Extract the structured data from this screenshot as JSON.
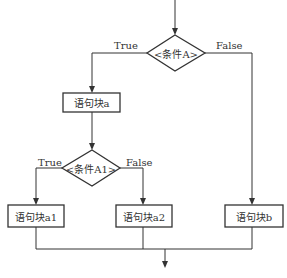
{
  "diagram": {
    "type": "flowchart",
    "nodes": {
      "condA": {
        "shape": "diamond",
        "label": "<条件A>"
      },
      "blockA": {
        "shape": "rect",
        "label": "语句块a"
      },
      "condA1": {
        "shape": "diamond",
        "label": "<条件A1>"
      },
      "blockA1": {
        "shape": "rect",
        "label": "语句块a1"
      },
      "blockA2": {
        "shape": "rect",
        "label": "语句块a2"
      },
      "blockB": {
        "shape": "rect",
        "label": "语句块b"
      }
    },
    "edges": {
      "condA_true": "True",
      "condA_false": "False",
      "condA1_true": "True",
      "condA1_false": "False"
    },
    "colors": {
      "line": "#333333",
      "background": "#ffffff"
    }
  }
}
